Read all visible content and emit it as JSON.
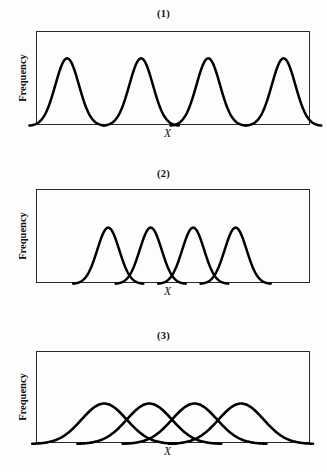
{
  "figure": {
    "background_color": "#fdfdfd",
    "curve_color": "#000000",
    "axis_color": "#2a2a2a",
    "ylabel": "Frequency",
    "xlabel": "X"
  },
  "panels": [
    {
      "id": "panel-1",
      "label": "(1)",
      "ylabel": "Frequency",
      "xlabel": "X",
      "overlap": "none",
      "box": {
        "x": 36,
        "y": 31,
        "width": 274,
        "height": 94
      },
      "label_y": 8,
      "xlabel_y": 127
    },
    {
      "id": "panel-2",
      "label": "(2)",
      "ylabel": "Frequency",
      "xlabel": "X",
      "overlap": "slight",
      "box": {
        "x": 36,
        "y": 189,
        "width": 274,
        "height": 94
      },
      "label_y": 168,
      "xlabel_y": 285
    },
    {
      "id": "panel-3",
      "label": "(3)",
      "ylabel": "Frequency",
      "xlabel": "X",
      "overlap": "broad",
      "box": {
        "x": 36,
        "y": 351,
        "width": 274,
        "height": 92
      },
      "label_y": 330,
      "xlabel_y": 445
    }
  ],
  "chart_data": [
    {
      "type": "line",
      "title": "(1)",
      "xlabel": "X",
      "ylabel": "Frequency",
      "grid": false,
      "legend": "none",
      "xlim": [
        0,
        100
      ],
      "ylim": [
        0,
        100
      ],
      "description": "Four narrow, well-separated unimodal frequency curves touching the baseline between modes",
      "series": [
        {
          "name": "mode-1",
          "peak_x": 11.0,
          "peak_y": 72,
          "sigma": 4.3
        },
        {
          "name": "mode-2",
          "peak_x": 38.0,
          "peak_y": 72,
          "sigma": 4.3
        },
        {
          "name": "mode-3",
          "peak_x": 62.5,
          "peak_y": 72,
          "sigma": 4.3
        },
        {
          "name": "mode-4",
          "peak_x": 90.0,
          "peak_y": 72,
          "sigma": 4.3
        }
      ]
    },
    {
      "type": "line",
      "title": "(2)",
      "xlabel": "X",
      "ylabel": "Frequency",
      "grid": false,
      "legend": "none",
      "xlim": [
        0,
        100
      ],
      "ylim": [
        0,
        100
      ],
      "description": "Four narrow frequency curves with slight overlap in their tails near the baseline",
      "series": [
        {
          "name": "mode-1",
          "peak_x": 26.0,
          "peak_y": 60,
          "sigma": 4.0
        },
        {
          "name": "mode-2",
          "peak_x": 41.5,
          "peak_y": 60,
          "sigma": 4.0
        },
        {
          "name": "mode-3",
          "peak_x": 57.0,
          "peak_y": 60,
          "sigma": 4.0
        },
        {
          "name": "mode-4",
          "peak_x": 72.5,
          "peak_y": 60,
          "sigma": 4.0
        }
      ]
    },
    {
      "type": "line",
      "title": "(3)",
      "xlabel": "X",
      "ylabel": "Frequency",
      "grid": false,
      "legend": "none",
      "xlim": [
        0,
        100
      ],
      "ylim": [
        0,
        100
      ],
      "description": "Four broad, heavily overlapping frequency curves crossing at roughly half their peak height",
      "series": [
        {
          "name": "mode-1",
          "peak_x": 24.5,
          "peak_y": 44,
          "sigma": 8.2
        },
        {
          "name": "mode-2",
          "peak_x": 41.0,
          "peak_y": 44,
          "sigma": 8.2
        },
        {
          "name": "mode-3",
          "peak_x": 57.5,
          "peak_y": 44,
          "sigma": 8.2
        },
        {
          "name": "mode-4",
          "peak_x": 74.5,
          "peak_y": 44,
          "sigma": 8.2
        }
      ]
    }
  ]
}
